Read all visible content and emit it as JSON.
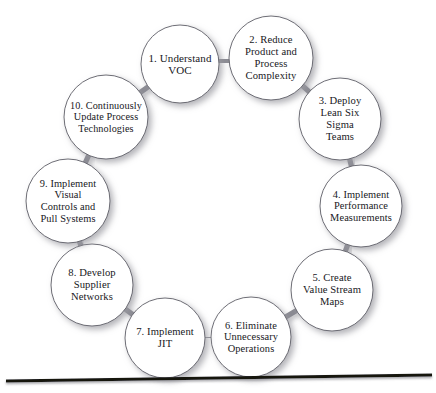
{
  "figure": {
    "type": "cycle-diagram",
    "node_count": 10,
    "background_color": "#ffffff",
    "node_fill_color": "#ffffff",
    "node_stroke_color": "#5d5d66",
    "connector_color": "#8a8a92",
    "shadow_color": "#b9b9bd",
    "text_color": "#17171c",
    "baseline_color": "#12120f",
    "center": {
      "x": 219,
      "y": 196
    },
    "ring_radius": 131,
    "node_radius": 41
  },
  "nodes": [
    {
      "id": "node-1",
      "number": "1.",
      "lines": [
        "1. Understand",
        "VOC"
      ],
      "full_label": "1. Understand VOC",
      "cx": 180,
      "cy": 64,
      "r": 39,
      "font_size": 11.0
    },
    {
      "id": "node-2",
      "number": "2.",
      "lines": [
        "2. Reduce",
        "Product and",
        "Process",
        "Complexity"
      ],
      "full_label": "2. Reduce Product and Process Complexity",
      "cx": 271,
      "cy": 58,
      "r": 42,
      "font_size": 10.6
    },
    {
      "id": "node-3",
      "number": "3.",
      "lines": [
        "3. Deploy",
        "Lean Six",
        "Sigma",
        "Teams"
      ],
      "full_label": "3. Deploy Lean Six Sigma Teams",
      "cx": 340,
      "cy": 119,
      "r": 41,
      "font_size": 10.6
    },
    {
      "id": "node-4",
      "number": "4.",
      "lines": [
        "4. Implement",
        "Performance",
        "Measurements"
      ],
      "full_label": "4. Implement Performance Measurements",
      "cx": 361,
      "cy": 206,
      "r": 41,
      "font_size": 10.4
    },
    {
      "id": "node-5",
      "number": "5.",
      "lines": [
        "5. Create",
        "Value Stream",
        "Maps"
      ],
      "full_label": "5. Create Value Stream Maps",
      "cx": 332,
      "cy": 290,
      "r": 41,
      "font_size": 10.6
    },
    {
      "id": "node-6",
      "number": "6.",
      "lines": [
        "6. Eliminate",
        "Unnecessary",
        "Operations"
      ],
      "full_label": "6. Eliminate Unnecessary Operations",
      "cx": 251,
      "cy": 337,
      "r": 40,
      "font_size": 10.4
    },
    {
      "id": "node-7",
      "number": "7.",
      "lines": [
        "7. Implement",
        "JIT"
      ],
      "full_label": "7. Implement JIT",
      "cx": 165,
      "cy": 338,
      "r": 40,
      "font_size": 10.6
    },
    {
      "id": "node-8",
      "number": "8.",
      "lines": [
        "8. Develop",
        "Supplier",
        "Networks"
      ],
      "full_label": "8. Develop Supplier Networks",
      "cx": 92,
      "cy": 285,
      "r": 41,
      "font_size": 10.6
    },
    {
      "id": "node-9",
      "number": "9.",
      "lines": [
        "9. Implement",
        "Visual",
        "Controls and",
        "Pull Systems"
      ],
      "full_label": "9. Implement Visual Controls and Pull Systems",
      "cx": 68,
      "cy": 201,
      "r": 42,
      "font_size": 10.4
    },
    {
      "id": "node-10",
      "number": "10.",
      "lines": [
        "10. Continuously",
        "Update Process",
        "Technologies"
      ],
      "full_label": "10. Continuously Update Process Technologies",
      "cx": 106,
      "cy": 117,
      "r": 42,
      "font_size": 10.2
    }
  ],
  "connectors": [
    {
      "from": "node-1",
      "to": "node-2"
    },
    {
      "from": "node-2",
      "to": "node-3"
    },
    {
      "from": "node-3",
      "to": "node-4"
    },
    {
      "from": "node-4",
      "to": "node-5"
    },
    {
      "from": "node-5",
      "to": "node-6"
    },
    {
      "from": "node-6",
      "to": "node-7"
    },
    {
      "from": "node-7",
      "to": "node-8"
    },
    {
      "from": "node-8",
      "to": "node-9"
    },
    {
      "from": "node-9",
      "to": "node-10"
    },
    {
      "from": "node-10",
      "to": "node-1"
    }
  ],
  "baseline": {
    "x1": 6,
    "y1": 381,
    "x2": 432,
    "y2": 375,
    "thickness": 3.2
  }
}
